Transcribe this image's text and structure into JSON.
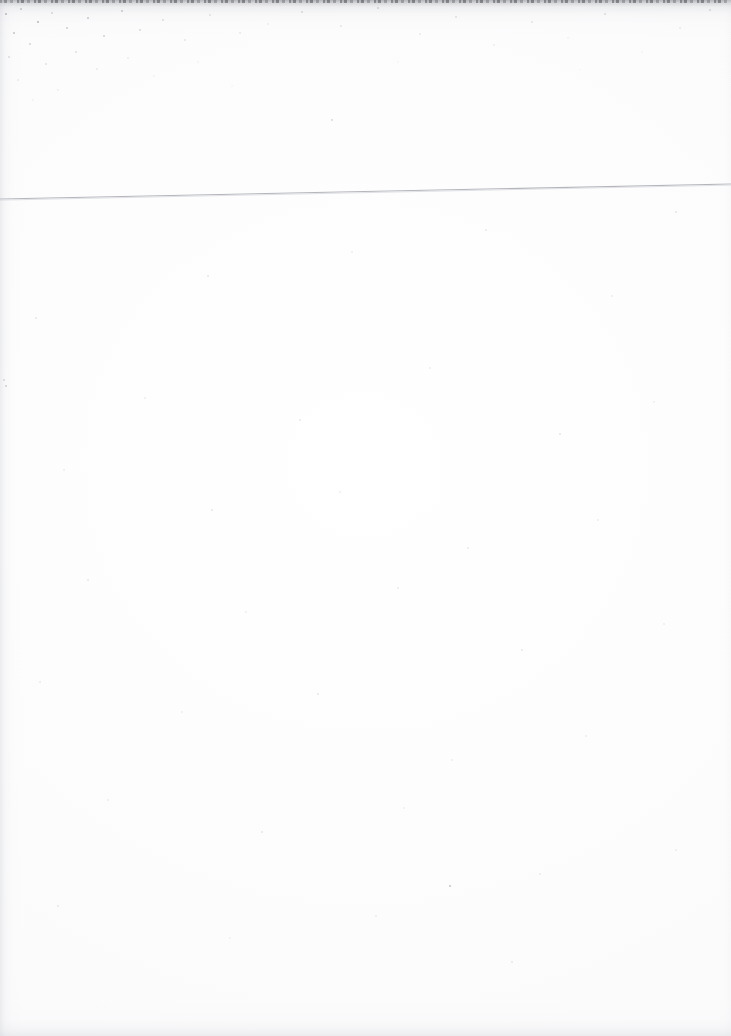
{
  "page": {
    "kind": "scanned-blank-page",
    "width": 731,
    "height": 1036,
    "background_color": "#fdfdfd",
    "caption": "",
    "body_text": "",
    "header_text": "",
    "footer_text": "",
    "page_number": ""
  },
  "rule": {
    "name": "horizontal-rule",
    "color": "#b4b6bc",
    "thickness_px": 1,
    "x_start": 0,
    "y_start": 199,
    "x_end": 731,
    "y_end": 184
  },
  "artifacts": {
    "top_edge_label": "",
    "left_edge_label": "",
    "bottom_edge_label": "",
    "noise_color": "#86888e"
  }
}
